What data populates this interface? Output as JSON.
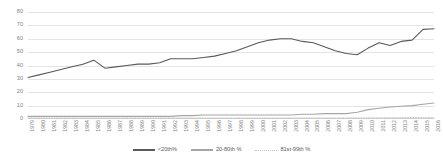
{
  "chart_data": {
    "type": "line",
    "title": "",
    "xlabel": "",
    "ylabel": "",
    "ylim": [
      0,
      80
    ],
    "ytick_values": [
      0,
      10,
      20,
      30,
      40,
      50,
      60,
      70,
      80
    ],
    "grid": true,
    "legend_position": "bottom",
    "categories": [
      "1979",
      "1980",
      "1981",
      "1982",
      "1983",
      "1984",
      "1985",
      "1986",
      "1987",
      "1988",
      "1989",
      "1990",
      "1991",
      "1992",
      "1993",
      "1994",
      "1995",
      "1996",
      "1997",
      "1998",
      "1999",
      "2000",
      "2001",
      "2002",
      "2003",
      "2004",
      "2005",
      "2006",
      "2007",
      "2008",
      "2009",
      "2010",
      "2011",
      "2012",
      "2013",
      "2014",
      "2015",
      "2016"
    ],
    "series": [
      {
        "name": "<20th%",
        "color": "#595959",
        "style": "solid",
        "values": [
          31,
          33,
          35,
          37,
          39,
          41,
          44,
          38,
          39,
          40,
          41,
          41,
          42,
          45,
          45,
          45,
          46,
          47,
          49,
          51,
          54,
          57,
          59,
          60,
          60,
          58,
          57,
          54,
          51,
          49,
          48,
          53,
          57,
          55,
          58,
          59,
          67,
          67.5
        ]
      },
      {
        "name": "20-80th %",
        "color": "#a6a6a6",
        "style": "solid",
        "values": [
          2,
          2,
          2,
          2,
          2,
          2,
          2,
          2,
          2,
          2,
          2,
          2,
          2,
          2,
          2.5,
          2.5,
          3,
          3,
          3,
          3,
          3,
          3,
          3,
          3,
          3,
          3.5,
          3.5,
          4,
          4,
          4,
          5,
          7,
          8,
          9,
          9.5,
          10,
          11,
          12
        ]
      },
      {
        "name": "81st-99th %",
        "color": "#bfbfbf",
        "style": "dotted",
        "values": [
          0.7,
          0.7,
          0.7,
          0.7,
          0.7,
          0.7,
          0.7,
          0.7,
          0.7,
          0.7,
          0.7,
          0.7,
          0.7,
          0.7,
          0.7,
          0.7,
          0.7,
          0.7,
          0.7,
          0.7,
          0.7,
          0.7,
          0.7,
          0.7,
          0.7,
          0.7,
          0.7,
          0.7,
          0.7,
          0.7,
          0.8,
          0.8,
          0.8,
          0.9,
          0.9,
          1.0,
          1.0,
          1.0
        ]
      }
    ]
  },
  "legend": {
    "items": [
      {
        "label": "<20th%"
      },
      {
        "label": "20-80th %"
      },
      {
        "label": "81st-99th %"
      }
    ]
  }
}
